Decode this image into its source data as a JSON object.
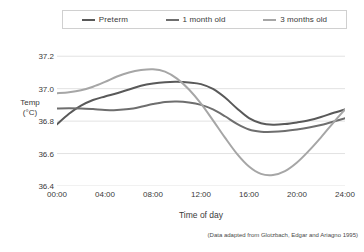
{
  "chart_data": {
    "type": "line",
    "title": "",
    "xlabel": "Time of day",
    "ylabel": "Temp (°C)",
    "xlim": [
      0,
      24
    ],
    "ylim": [
      36.4,
      37.3
    ],
    "xticks": [
      "00:00",
      "04:00",
      "08:00",
      "12:00",
      "16:00",
      "20:00",
      "24:00"
    ],
    "xtick_values": [
      0,
      4,
      8,
      12,
      16,
      20,
      24
    ],
    "yticks": [
      "37.2",
      "37.0",
      "36.8",
      "36.6",
      "36.4"
    ],
    "ytick_values": [
      37.2,
      37.0,
      36.8,
      36.6,
      36.4
    ],
    "grid": "horizontal",
    "legend_position": "top",
    "x": [
      0,
      1,
      2,
      3,
      4,
      5,
      6,
      7,
      8,
      9,
      10,
      11,
      12,
      13,
      14,
      15,
      16,
      17,
      18,
      19,
      20,
      21,
      22,
      23,
      24
    ],
    "series": [
      {
        "name": "Preterm",
        "color": "#595959",
        "values": [
          36.78,
          36.845,
          36.895,
          36.93,
          36.952,
          36.972,
          36.995,
          37.018,
          37.032,
          37.04,
          37.042,
          37.038,
          37.028,
          36.998,
          36.945,
          36.878,
          36.818,
          36.787,
          36.778,
          36.782,
          36.792,
          36.805,
          36.825,
          36.85,
          36.872
        ]
      },
      {
        "name": "1 month old",
        "color": "#6e6e6e",
        "values": [
          36.878,
          36.879,
          36.878,
          36.874,
          36.869,
          36.868,
          36.874,
          36.888,
          36.905,
          36.918,
          36.921,
          36.915,
          36.9,
          36.872,
          36.83,
          36.783,
          36.748,
          36.735,
          36.734,
          36.739,
          36.748,
          36.76,
          36.776,
          36.796,
          36.818
        ]
      },
      {
        "name": "3 months old",
        "color": "#a6a6a6",
        "values": [
          36.972,
          36.978,
          36.99,
          37.012,
          37.042,
          37.075,
          37.1,
          37.115,
          37.12,
          37.105,
          37.062,
          36.995,
          36.908,
          36.805,
          36.698,
          36.598,
          36.52,
          36.475,
          36.468,
          36.492,
          36.545,
          36.618,
          36.7,
          36.788,
          36.872
        ]
      }
    ]
  },
  "legend": {
    "items": [
      {
        "label": "Preterm",
        "color": "#595959"
      },
      {
        "label": "1 month old",
        "color": "#6e6e6e"
      },
      {
        "label": "3 months old",
        "color": "#a6a6a6"
      }
    ]
  },
  "axes": {
    "y_label_line1": "Temp",
    "y_label_line2": "(°C)",
    "x_label": "Time of day"
  },
  "source": {
    "text": "(Data adapted from Glotzbach, Edgar and Ariagno 1995)"
  },
  "style": {
    "grid_color": "#e2e2e2",
    "text_color": "#3a3a3a",
    "background": "#ffffff"
  }
}
